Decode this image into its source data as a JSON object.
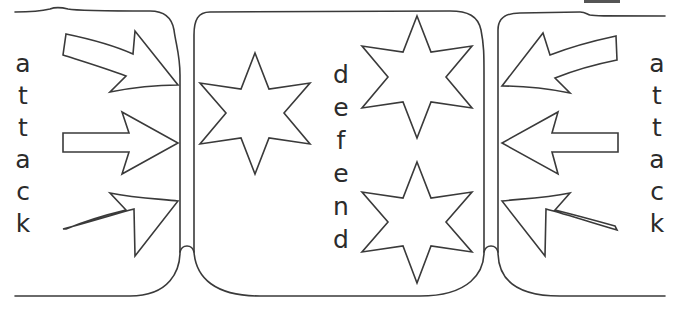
{
  "worksheet": {
    "left_panel": {
      "label": "attack",
      "letters": [
        "a",
        "t",
        "t",
        "a",
        "c",
        "k"
      ],
      "arrows": [
        {
          "name": "arrow-upper-left",
          "direction": "right-down"
        },
        {
          "name": "arrow-middle-left",
          "direction": "right"
        },
        {
          "name": "arrow-lower-left",
          "direction": "right-up"
        }
      ]
    },
    "middle_panel": {
      "label": "defend",
      "letters": [
        "d",
        "e",
        "f",
        "e",
        "n",
        "d"
      ],
      "stars": [
        {
          "name": "star-left",
          "points": 6
        },
        {
          "name": "star-top-right",
          "points": 6
        },
        {
          "name": "star-bottom-right",
          "points": 6
        }
      ]
    },
    "right_panel": {
      "label": "attack",
      "letters": [
        "a",
        "t",
        "t",
        "a",
        "c",
        "k"
      ],
      "arrows": [
        {
          "name": "arrow-upper-right",
          "direction": "left-down"
        },
        {
          "name": "arrow-middle-right",
          "direction": "left"
        },
        {
          "name": "arrow-lower-right",
          "direction": "left-up"
        }
      ]
    },
    "colors": {
      "line": "#3a3a3a",
      "text": "#2b2b2b",
      "background": "#ffffff"
    }
  }
}
